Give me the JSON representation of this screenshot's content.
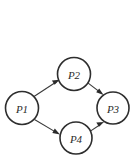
{
  "diagram": {
    "type": "directed-graph",
    "title": "",
    "background_color": "#ffffff",
    "node_stroke_color": "#2e2e2e",
    "node_fill_color": "#ffffff",
    "edge_color": "#3a3a3a",
    "label_color": "#2b2b2b",
    "nodes": [
      {
        "id": "P1",
        "label": "P1",
        "cx": 22,
        "cy": 108,
        "r": 16.5
      },
      {
        "id": "P2",
        "label": "P2",
        "cx": 74,
        "cy": 74,
        "r": 16.5
      },
      {
        "id": "P3",
        "label": "P3",
        "cx": 113,
        "cy": 108,
        "r": 16.0
      },
      {
        "id": "P4",
        "label": "P4",
        "cx": 76,
        "cy": 138,
        "r": 16.0
      }
    ],
    "edges": [
      {
        "id": "e1",
        "from": "P1",
        "to": "P2",
        "arrowhead": "filled-triangle"
      },
      {
        "id": "e2",
        "from": "P1",
        "to": "P4",
        "arrowhead": "filled-triangle"
      },
      {
        "id": "e3",
        "from": "P2",
        "to": "P3",
        "arrowhead": "filled-triangle"
      },
      {
        "id": "e4",
        "from": "P4",
        "to": "P3",
        "arrowhead": "filled-triangle"
      }
    ]
  }
}
